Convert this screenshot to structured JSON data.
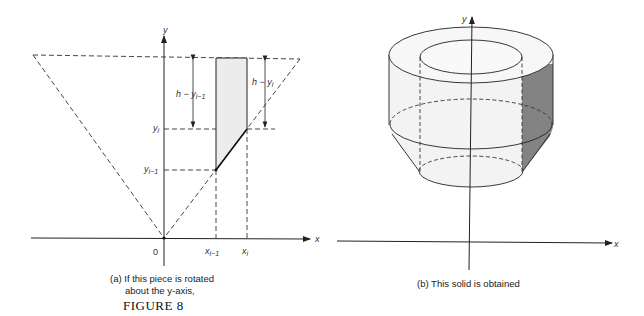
{
  "figure": {
    "title": "FIGURE 8",
    "panel_a": {
      "caption_line1": "(a)  If this piece is rotated",
      "caption_line2": "about the y-axis,",
      "labels": {
        "y_axis": "y",
        "x_axis": "x",
        "origin": "0",
        "h_minus_y_im1": "h − y",
        "h_minus_y_im1_sub": "i−1",
        "h_minus_y_i": "h − y",
        "h_minus_y_i_sub": "i",
        "y_i": "y",
        "y_i_sub": "i",
        "y_im1": "y",
        "y_im1_sub": "i−1",
        "x_im1": "x",
        "x_im1_sub": "i−1",
        "x_i": "x",
        "x_i_sub": "i"
      }
    },
    "panel_b": {
      "caption": "(b)  This solid is obtained",
      "labels": {
        "y_axis": "y",
        "x_axis": "x"
      }
    },
    "colors": {
      "line": "#222222",
      "piece_fill": "#ececec",
      "solid_fill": "#f3f3f3",
      "shaded_section": "#838383"
    }
  }
}
